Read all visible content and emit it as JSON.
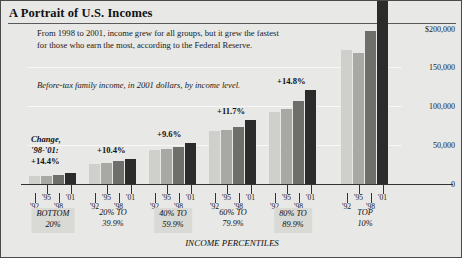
{
  "header": {
    "title": "A Portrait of U.S. Incomes",
    "deck": "From 1998 to 2001, income grew for all groups, but it grew the fastest for those who earn the most, according to the Federal Reserve.",
    "subtitle": "Before-tax family income, in 2001 dollars, by income level.",
    "axis_top_label": "$200,000"
  },
  "change_note": {
    "line1": "Change,",
    "line2": "'98-'01:",
    "line3": "+14.4%"
  },
  "axis": {
    "x_title": "INCOME PERCENTILES",
    "y_ticks": [
      "$200,000",
      "150,000",
      "100,000",
      "50,000",
      "0"
    ],
    "y_tick_values": [
      200000,
      150000,
      100000,
      50000,
      0
    ]
  },
  "colors": {
    "figure_background": "#e8e8e6",
    "border": "#4a4a4a",
    "bar_1992": "#cfcfcb",
    "bar_1995": "#a8a8a4",
    "bar_1998": "#6e6e6b",
    "bar_2001": "#2b2b2b",
    "gridline": "#f7f7f5",
    "caption_shade": "#d9d9d6"
  },
  "chart_data": {
    "type": "bar",
    "title": "A Portrait of U.S. Incomes",
    "subtitle": "Before-tax family income, in 2001 dollars, by income level.",
    "xlabel": "INCOME PERCENTILES",
    "ylabel": "",
    "ylim": [
      0,
      200000
    ],
    "ytick_values": [
      0,
      50000,
      100000,
      150000,
      200000
    ],
    "ytick_labels": [
      "0",
      "50,000",
      "100,000",
      "150,000",
      "$200,000"
    ],
    "grid": true,
    "legend_position": "none",
    "categories": [
      "BOTTOM 20%",
      "20% TO 39.9%",
      "40% TO 59.9%",
      "60% TO 79.9%",
      "80% TO 89.9%",
      "TOP 10%"
    ],
    "category_lines": [
      [
        "BOTTOM",
        "20%"
      ],
      [
        "20% TO",
        "39.9%"
      ],
      [
        "40% TO",
        "59.9%"
      ],
      [
        "60% TO",
        "79.9%"
      ],
      [
        "80% TO",
        "89.9%"
      ],
      [
        "TOP",
        "10%"
      ]
    ],
    "year_labels": [
      "'92",
      "'95",
      "'98",
      "'01"
    ],
    "series": [
      {
        "name": "'92",
        "values": [
          10300,
          25600,
          43500,
          67500,
          92000,
          172000
        ]
      },
      {
        "name": "'95",
        "values": [
          10900,
          26400,
          45200,
          69500,
          96000,
          168000
        ]
      },
      {
        "name": "'98",
        "values": [
          11800,
          28900,
          47500,
          73000,
          106000,
          196000
        ]
      },
      {
        "name": "'01",
        "values": [
          13500,
          31900,
          52000,
          81500,
          121000,
          234000
        ]
      }
    ],
    "annotations": [
      {
        "group": "BOTTOM 20%",
        "label": "+14.4%"
      },
      {
        "group": "20% TO 39.9%",
        "label": "+10.4%"
      },
      {
        "group": "40% TO 59.9%",
        "label": "+9.6%"
      },
      {
        "group": "60% TO 79.9%",
        "label": "+11.7%"
      },
      {
        "group": "80% TO 89.9%",
        "label": "+14.8%"
      },
      {
        "group": "TOP 10%",
        "label": "+19.3%"
      }
    ],
    "bar_pixel_heights": [
      [
        5,
        6,
        8,
        11
      ],
      [
        17,
        18,
        21,
        25
      ],
      [
        31,
        32,
        35,
        40
      ],
      [
        46,
        48,
        53,
        58
      ],
      [
        56,
        59,
        66,
        73
      ],
      [
        98,
        96,
        109,
        128
      ]
    ],
    "note": "Change '98-'01 percentages annotate growth of the last two bars in each group."
  }
}
